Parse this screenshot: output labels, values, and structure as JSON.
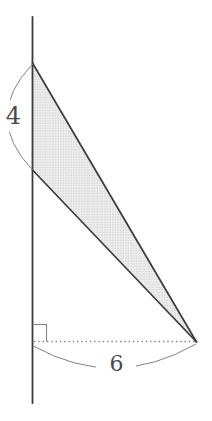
{
  "figure": {
    "type": "geometry-diagram",
    "labels": {
      "vertical_segment": "4",
      "horizontal_base": "6"
    },
    "colors": {
      "background": "#ffffff",
      "line": "#3b3b3b",
      "aux": "#838383",
      "label": "#4a4a4a",
      "fill_bg": "#eeeeee",
      "fill_dot": "#c9c9c9",
      "label_mask": "#ffffff"
    }
  }
}
